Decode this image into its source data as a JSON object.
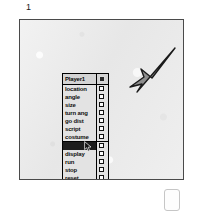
{
  "figure": {
    "number": "1"
  },
  "canvas": {
    "background_color": "#ebebeb",
    "border_color": "#4a4a4a",
    "sketch": {
      "name": "arrow-sketch",
      "fill_color": "#8d8d8d",
      "outline_color": "#1a1a1a"
    }
  },
  "viewer_panel": {
    "header": {
      "title": "Player1",
      "button_icon": "menu-icon"
    },
    "groups": [
      {
        "items": [
          {
            "label": "location",
            "checked": false,
            "selected": false
          },
          {
            "label": "angle",
            "checked": false,
            "selected": false
          },
          {
            "label": "size",
            "checked": false,
            "selected": false
          },
          {
            "label": "turn ang",
            "checked": false,
            "selected": false
          },
          {
            "label": "go dist",
            "checked": false,
            "selected": false
          },
          {
            "label": "script",
            "checked": false,
            "selected": false
          },
          {
            "label": "costume",
            "checked": false,
            "selected": false
          }
        ]
      },
      {
        "items": [
          {
            "label": "erase",
            "checked": false,
            "selected": true
          },
          {
            "label": "display",
            "checked": false,
            "selected": false
          },
          {
            "label": "run",
            "checked": false,
            "selected": false
          },
          {
            "label": "stop",
            "checked": false,
            "selected": false
          },
          {
            "label": "reset",
            "checked": false,
            "selected": false
          },
          {
            "label": "twin",
            "checked": false,
            "selected": false
          },
          {
            "label": "more",
            "checked": false,
            "selected": false
          }
        ]
      }
    ]
  },
  "pointer": {
    "icon": "mouse-cursor-icon"
  },
  "detached_tile": {
    "name": "detached-tile",
    "fill_color": "#fdfdfd",
    "border_color": "#c6c6c6"
  }
}
